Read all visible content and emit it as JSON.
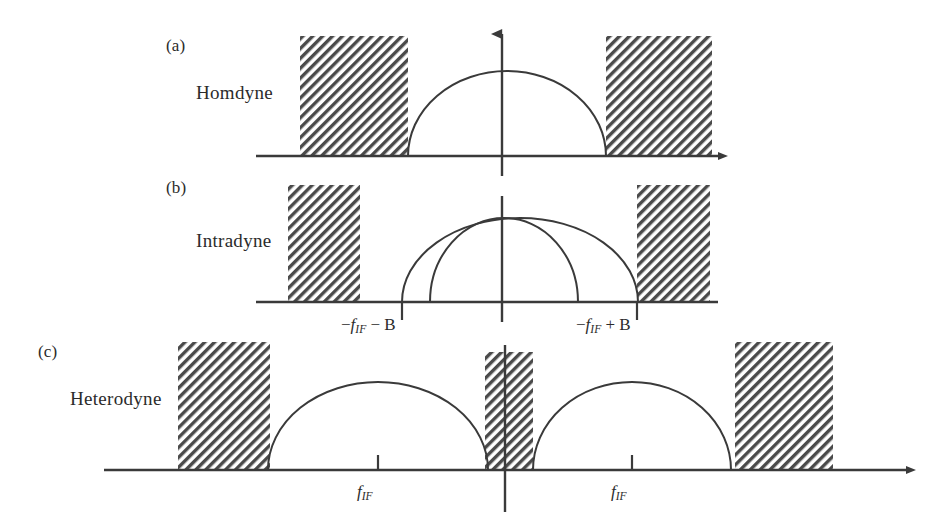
{
  "figure": {
    "background_color": "#ffffff",
    "ink_color": "#3a3a3a",
    "hatch_color": "#4a4a4a",
    "hatch_angle_deg": 45
  },
  "panels": [
    {
      "letter": "(a)",
      "name": "Homdyne",
      "axis_y": 156,
      "origin_x": 502,
      "has_vertical_arrow": true,
      "arcs": [
        {
          "center_x": 507,
          "half_width": 99,
          "height": 85
        }
      ],
      "blocks": [
        {
          "x": 300,
          "width": 108,
          "top": 36
        },
        {
          "x": 606,
          "width": 106,
          "top": 36
        }
      ],
      "ticks": [],
      "tick_labels": []
    },
    {
      "letter": "(b)",
      "name": "Intradyne",
      "axis_y": 302,
      "origin_x": 502,
      "has_vertical_arrow": false,
      "arcs": [
        {
          "center_x": 520,
          "half_width": 118,
          "height": 84
        },
        {
          "center_x": 476,
          "half_width": 74,
          "height": 84
        }
      ],
      "blocks": [
        {
          "x": 288,
          "width": 72,
          "top": 185
        },
        {
          "x": 637,
          "width": 73,
          "top": 185
        }
      ],
      "ticks": [
        402,
        637
      ],
      "tick_labels": [
        {
          "x": 402,
          "text": "-f_IF - B",
          "minus": "−",
          "symbol": "f",
          "sub": "IF",
          "op": "−",
          "operand": "B"
        },
        {
          "x": 637,
          "text": "-f_IF + B",
          "minus": "−",
          "symbol": "f",
          "sub": "IF",
          "op": "+",
          "operand": "B"
        }
      ]
    },
    {
      "letter": "(c)",
      "name": "Heterodyne",
      "axis_y": 470,
      "origin_x": 505,
      "has_vertical_arrow": false,
      "arcs": [
        {
          "center_x": 378,
          "half_width": 110,
          "height": 88
        },
        {
          "center_x": 632,
          "half_width": 99,
          "height": 88
        }
      ],
      "blocks": [
        {
          "x": 178,
          "width": 92,
          "top": 342
        },
        {
          "x": 485,
          "width": 48,
          "top": 352
        },
        {
          "x": 735,
          "width": 98,
          "top": 342
        }
      ],
      "ticks": [
        378,
        632
      ],
      "tick_labels": [
        {
          "x": 378,
          "text": "f_IF",
          "minus": "",
          "symbol": "f",
          "sub": "IF",
          "op": "",
          "operand": ""
        },
        {
          "x": 632,
          "text": "f_IF",
          "minus": "",
          "symbol": "f",
          "sub": "IF",
          "op": "",
          "operand": ""
        }
      ]
    }
  ],
  "labels": {
    "panel_a_letter": "(a)",
    "panel_a_name": "Homdyne",
    "panel_b_letter": "(b)",
    "panel_b_name": "Intradyne",
    "panel_c_letter": "(c)",
    "panel_c_name": "Heterodyne",
    "axis_b_left_minus": "−",
    "axis_b_left_f": "f",
    "axis_b_left_sub": "IF",
    "axis_b_left_rest": " − B",
    "axis_b_right_minus": "−",
    "axis_b_right_f": "f",
    "axis_b_right_sub": "IF",
    "axis_b_right_rest": " + B",
    "axis_c_left_f": "f",
    "axis_c_left_sub": "IF",
    "axis_c_right_f": "f",
    "axis_c_right_sub": "IF"
  }
}
